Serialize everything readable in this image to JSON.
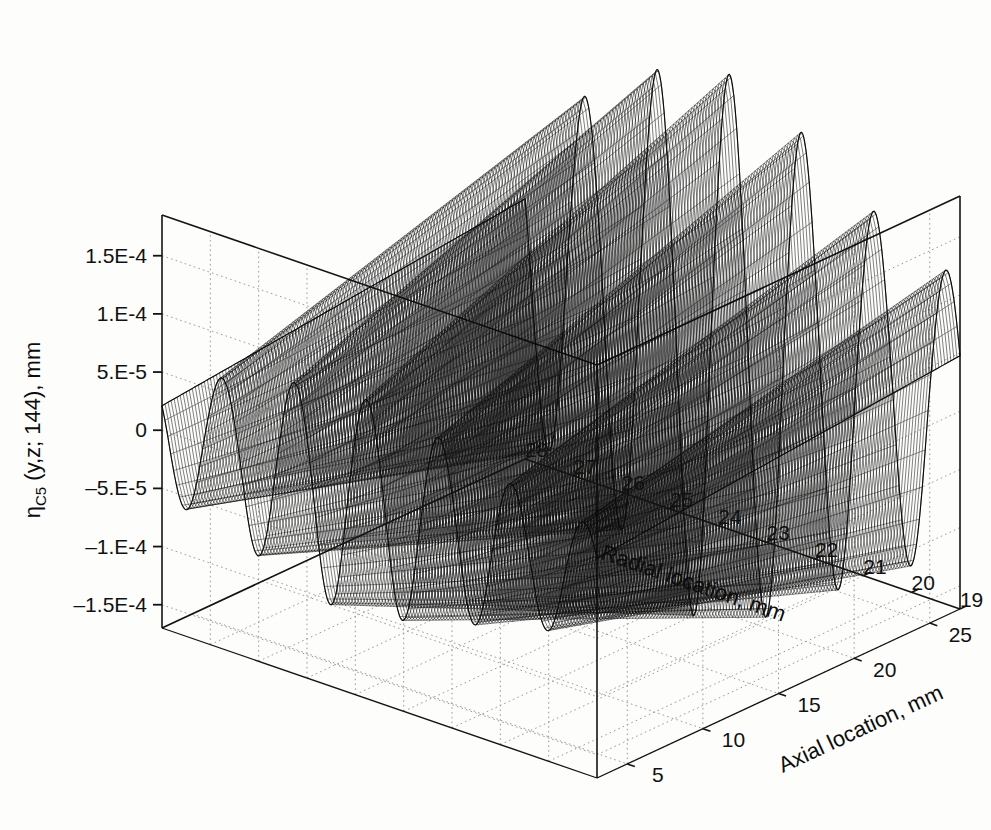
{
  "figure": {
    "background_color": "#fdfdfc",
    "line_color": "#141414",
    "grid_color": "#9a9a9a",
    "mesh_color": "#0a0a0a"
  },
  "chart_data": {
    "type": "surface",
    "title": "",
    "subtitle": "",
    "zlabel_main": "η",
    "zlabel_sub": "C5",
    "zlabel_rest": " (y,z; 144), mm",
    "zlabel_full": "ηC5 (y,z; 144), mm",
    "xlabel": "Radial location, mm",
    "ylabel": "Axial location, mm",
    "grid": true,
    "legend": false,
    "x_name": "Radial location",
    "x_unit": "mm",
    "x_ticks": [
      28,
      27,
      26,
      25,
      24,
      23,
      22,
      21,
      20,
      19
    ],
    "xlim": [
      28,
      19
    ],
    "y_name": "Axial location",
    "y_unit": "mm",
    "y_ticks": [
      5,
      10,
      15,
      20,
      25
    ],
    "ylim": [
      3,
      27
    ],
    "z_ticks": [
      {
        "value": 0.00015,
        "label": "1.5E-4"
      },
      {
        "value": 0.0001,
        "label": "1.E-4"
      },
      {
        "value": 5e-05,
        "label": "5.E-5"
      },
      {
        "value": 0,
        "label": "0"
      },
      {
        "value": -5e-05,
        "label": "–5.E-5"
      },
      {
        "value": -0.0001,
        "label": "–1.E-4"
      },
      {
        "value": -0.00015,
        "label": "–1.5E-4"
      }
    ],
    "zlim": [
      -0.00017,
      0.000185
    ],
    "surface_model": {
      "description": "standing-wave mode shape: radial oscillation times axial oscillation",
      "radial_wave_cycles": 6.0,
      "radial_phase": 0.18,
      "axial_wave_cycles": 1.0,
      "axial_phase": 0.0,
      "amplitude": 0.00016,
      "peak_count_back_edge": 6,
      "peak_amplitudes_back_edge": [
        9e-05,
        0.000125,
        0.000165,
        0.000145,
        0.000105,
        8e-05
      ],
      "trough_amplitudes_front_edge": [
        -0.00011,
        -0.000145,
        -0.000175,
        -0.000155,
        -0.000125,
        -9e-05
      ],
      "mesh_rows": 120,
      "mesh_cols": 150
    },
    "view": {
      "elevation_deg": 22,
      "azimuth_deg": -52
    }
  },
  "axes_box": {
    "corner_top_back": {
      "x": 516,
      "y": 41
    },
    "corner_left_top": {
      "x": 162,
      "y": 215
    },
    "corner_right_top": {
      "x": 960,
      "y": 196
    },
    "corner_left_bottom": {
      "x": 162,
      "y": 628
    },
    "corner_right_bottom": {
      "x": 960,
      "y": 609
    },
    "corner_front_bottom": {
      "x": 597,
      "y": 778
    }
  }
}
